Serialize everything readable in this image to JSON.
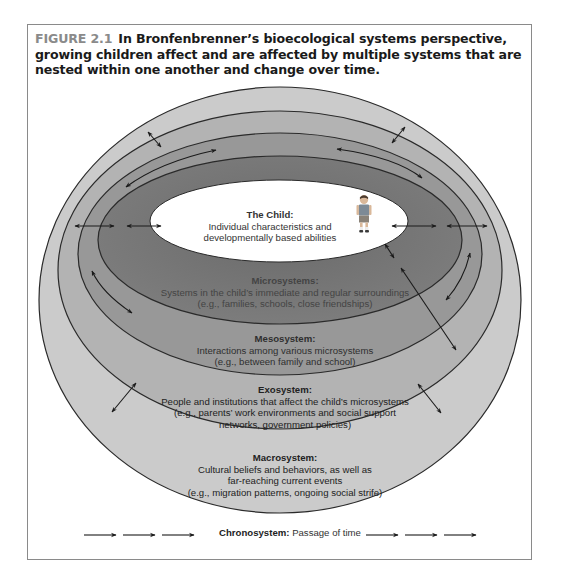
{
  "figure": {
    "label": "FIGURE 2.1",
    "caption": "In Bronfenbrenner’s bioecological systems perspective, growing children affect and are affected by multiple systems that are nested within one another and change over time."
  },
  "systems": {
    "child": {
      "title": "The Child:",
      "lines": [
        "Individual characteristics and",
        "developmentally based abilities"
      ],
      "color": "#ffffff"
    },
    "microsystems": {
      "title": "Microsystems:",
      "lines": [
        "Systems in the child’s immediate and regular surroundings",
        "(e.g., families, schools, close friendships)"
      ],
      "color": "#6f6f6f"
    },
    "mesosystem": {
      "title": "Mesosystem:",
      "lines": [
        "Interactions among various microsystems",
        "(e.g., between family and school)"
      ],
      "color": "#989898"
    },
    "exosystem": {
      "title": "Exosystem:",
      "lines": [
        "People and institutions that affect the child’s microsystems",
        "(e.g., parents’ work environments and social support",
        "networks, government policies)"
      ],
      "color": "#b3b3b3"
    },
    "macrosystem": {
      "title": "Macrosystem:",
      "lines": [
        "Cultural beliefs and behaviors, as well as",
        "far-reaching current events",
        "(e.g., migration patterns, ongoing social strife)"
      ],
      "color": "#cbcbcb"
    }
  },
  "chronosystem": {
    "title": "Chronosystem:",
    "text": "Passage of time",
    "arrows_left": 3,
    "arrows_right": 3
  },
  "icons": {
    "child_figure": "standing-child-figure",
    "bidirectional_arrow": "double-headed-arrow",
    "time_arrow": "right-arrow"
  }
}
